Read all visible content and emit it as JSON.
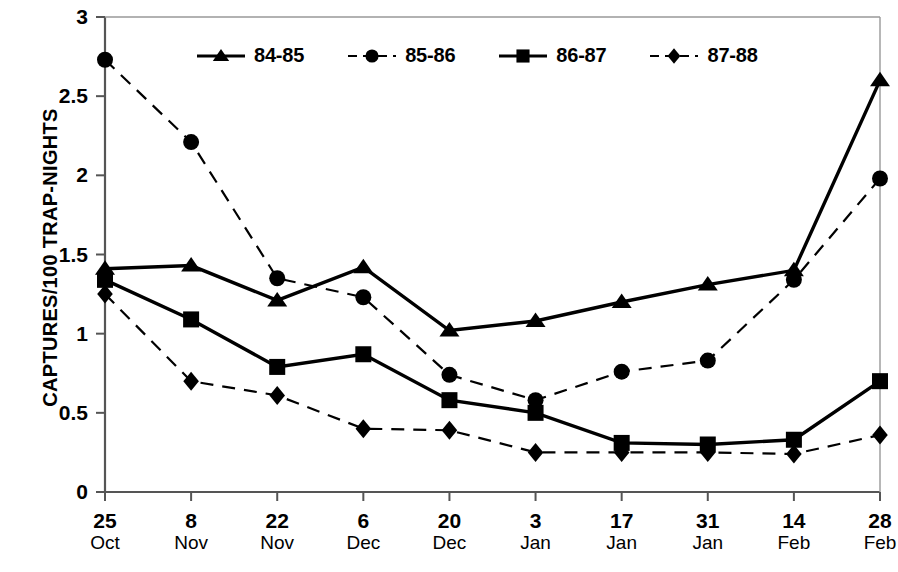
{
  "chart_data": {
    "type": "line",
    "title": "",
    "xlabel": "",
    "ylabel": "CAPTURES/100 TRAP-NIGHTS",
    "ylim": [
      0,
      3
    ],
    "yticks": [
      "0",
      "0.5",
      "1",
      "1.5",
      "2",
      "2.5",
      "3"
    ],
    "ytick_values": [
      0,
      0.5,
      1,
      1.5,
      2,
      2.5,
      3
    ],
    "grid": false,
    "legend_position": "top-center",
    "categories": [
      "25 Oct",
      "8 Nov",
      "22 Nov",
      "6 Dec",
      "20 Dec",
      "3 Jan",
      "17 Jan",
      "31 Jan",
      "14 Feb",
      "28 Feb"
    ],
    "xtick_days": [
      "25",
      "8",
      "22",
      "6",
      "20",
      "3",
      "17",
      "31",
      "14",
      "28"
    ],
    "xtick_months": [
      "Oct",
      "Nov",
      "Nov",
      "Dec",
      "Dec",
      "Jan",
      "Jan",
      "Jan",
      "Feb",
      "Feb"
    ],
    "series": [
      {
        "name": "84-85",
        "marker": "triangle",
        "linestyle": "solid",
        "color": "#000000",
        "values": [
          1.41,
          1.43,
          1.21,
          1.42,
          1.02,
          1.08,
          1.2,
          1.31,
          1.4,
          2.6
        ]
      },
      {
        "name": "85-86",
        "marker": "circle",
        "linestyle": "dashed",
        "color": "#000000",
        "values": [
          2.73,
          2.21,
          1.35,
          1.23,
          0.74,
          0.58,
          0.76,
          0.83,
          1.34,
          1.98
        ]
      },
      {
        "name": "86-87",
        "marker": "square",
        "linestyle": "solid",
        "color": "#000000",
        "values": [
          1.34,
          1.09,
          0.79,
          0.87,
          0.58,
          0.5,
          0.31,
          0.3,
          0.33,
          0.7
        ]
      },
      {
        "name": "87-88",
        "marker": "diamond",
        "linestyle": "dashed",
        "color": "#000000",
        "values": [
          1.25,
          0.7,
          0.61,
          0.4,
          0.39,
          0.25,
          0.25,
          0.25,
          0.24,
          0.36
        ]
      }
    ]
  },
  "axes": {
    "plot_left": 105,
    "plot_right": 880,
    "plot_top": 17,
    "plot_bottom": 492
  }
}
